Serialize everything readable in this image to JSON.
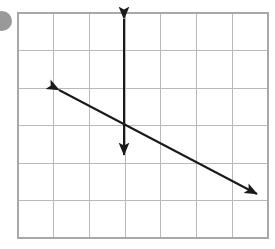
{
  "figure": {
    "kind": "coordinate-grid-with-two-lines",
    "canvas": {
      "width": 275,
      "height": 249,
      "background": "#ffffff"
    },
    "grid": {
      "name": "graph-paper-grid",
      "x0": 18,
      "y0": 13,
      "x1": 268,
      "y1": 238,
      "columns": 7,
      "rows": 6,
      "cell_width": 35.7,
      "cell_height": 37.5,
      "x_lines": [
        18,
        53.7,
        89.4,
        125.1,
        160.8,
        196.5,
        232.2,
        268
      ],
      "y_lines": [
        13,
        50.5,
        88,
        125.5,
        163,
        200.5,
        238
      ],
      "line_color": "#b9b9b9",
      "border_color": "#a8a8a8",
      "line_width": 1
    },
    "lines": [
      {
        "name": "vertical-line",
        "label": "vertical double-headed arrow",
        "color": "#1a1a1a",
        "width": 2,
        "arrow_start": true,
        "arrow_end": true,
        "from": {
          "x": 124,
          "y": 16
        },
        "to": {
          "x": 124,
          "y": 158
        },
        "orientation": "vertical",
        "slope": "undefined"
      },
      {
        "name": "diagonal-line",
        "label": "negative-slope double-headed arrow",
        "color": "#1a1a1a",
        "width": 2,
        "arrow_start": true,
        "arrow_end": true,
        "from": {
          "x": 55,
          "y": 88
        },
        "to": {
          "x": 261,
          "y": 196
        },
        "orientation": "diagonal",
        "slope": "negative"
      }
    ],
    "intersection": {
      "x": 124,
      "y": 122
    },
    "marker": {
      "name": "corner-dot",
      "shape": "circle",
      "cx": 2,
      "cy": 21,
      "r": 10,
      "color": "#999999",
      "clipped_at_left_edge": true
    }
  }
}
